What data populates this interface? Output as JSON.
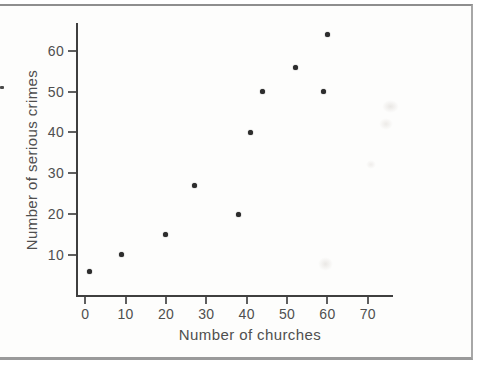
{
  "chart_data": {
    "type": "scatter",
    "title": "",
    "xlabel": "Number of churches",
    "ylabel": "Number of serious crimes",
    "points": [
      {
        "x": 1,
        "y": 6
      },
      {
        "x": 9,
        "y": 10
      },
      {
        "x": 20,
        "y": 15
      },
      {
        "x": 27,
        "y": 27
      },
      {
        "x": 38,
        "y": 20
      },
      {
        "x": 41,
        "y": 40
      },
      {
        "x": 44,
        "y": 50
      },
      {
        "x": 52,
        "y": 56
      },
      {
        "x": 59,
        "y": 50
      },
      {
        "x": 60,
        "y": 64
      }
    ],
    "xticks": [
      0,
      10,
      20,
      30,
      40,
      50,
      60,
      70
    ],
    "yticks": [
      10,
      20,
      30,
      40,
      50,
      60
    ],
    "xlim": [
      -2.3,
      76.0
    ],
    "ylim": [
      0.2,
      66.8
    ],
    "grid": false,
    "legend": null,
    "marker_shape": "circle",
    "marker_color": "#2d2d2d",
    "axis_color": "#3f3f3f",
    "tick_color": "#5f5f5f",
    "text_color": "#4f4f4f"
  }
}
